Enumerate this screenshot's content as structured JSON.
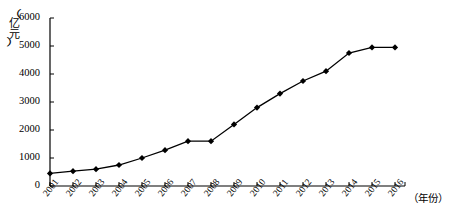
{
  "chart_data": {
    "type": "line",
    "title": "",
    "xlabel": "（年份）",
    "ylabel": "（亿元）",
    "ylabel_chars": [
      "亿",
      "元"
    ],
    "categories": [
      "2001",
      "2002",
      "2003",
      "2004",
      "2005",
      "2006",
      "2007",
      "2008",
      "2009",
      "2010",
      "2011",
      "2012",
      "2013",
      "2014",
      "2015",
      "2016"
    ],
    "values": [
      450,
      530,
      600,
      750,
      1000,
      1280,
      1600,
      1600,
      2200,
      2800,
      3300,
      3750,
      4100,
      4750,
      4950,
      4950
    ],
    "yticks": [
      0,
      1000,
      2000,
      3000,
      4000,
      5000,
      6000
    ],
    "ytick_labels": [
      "0",
      "1000",
      "2000",
      "3000",
      "4000",
      "5000",
      "6000"
    ],
    "ylim": [
      0,
      6000
    ],
    "grid": false,
    "legend": null,
    "marker": "diamond",
    "series_color": "#000000",
    "axis_color": "#000000",
    "background": "#ffffff"
  },
  "axis": {
    "y_unit_open_paren": "（",
    "y_unit_close_paren": "）"
  }
}
